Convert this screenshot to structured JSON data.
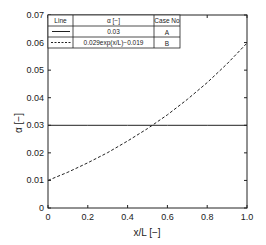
{
  "chart_data": {
    "type": "line",
    "title": "",
    "xlabel": "x/L [−]",
    "ylabel": "α [−]",
    "xlim": [
      0,
      1.0
    ],
    "ylim": [
      0,
      0.07
    ],
    "grid": false,
    "x_ticks": [
      0,
      0.2,
      0.4,
      0.6,
      0.8,
      1.0
    ],
    "x_tick_labels": [
      "0",
      "0.2",
      "0.4",
      "0.6",
      "0.8",
      "1.0"
    ],
    "y_ticks": [
      0,
      0.01,
      0.02,
      0.03,
      0.04,
      0.05,
      0.06,
      0.07
    ],
    "y_tick_labels": [
      "0",
      "0.01",
      "0.02",
      "0.03",
      "0.04",
      "0.05",
      "0.06",
      "0.07"
    ],
    "legend_position": "upper-left (table)",
    "legend_headers": [
      "Line",
      "α [−]",
      "Case No"
    ],
    "series": [
      {
        "name": "A",
        "case": "A",
        "style": "solid",
        "formula": "0.03",
        "x": [
          0,
          0.2,
          0.4,
          0.6,
          0.8,
          1.0
        ],
        "values": [
          0.03,
          0.03,
          0.03,
          0.03,
          0.03,
          0.03
        ]
      },
      {
        "name": "B",
        "case": "B",
        "style": "dashed",
        "formula": "0.029exp(x/L)−0.019",
        "x": [
          0,
          0.1,
          0.2,
          0.3,
          0.4,
          0.5,
          0.6,
          0.7,
          0.8,
          0.9,
          1.0
        ],
        "values": [
          0.01,
          0.013,
          0.0164,
          0.0201,
          0.0243,
          0.0288,
          0.0338,
          0.0394,
          0.0455,
          0.0523,
          0.0598
        ]
      }
    ]
  },
  "legend": {
    "header_line": "Line",
    "header_alpha": "α [−]",
    "header_case": "Case No",
    "rows": [
      {
        "alpha": "0.03",
        "case": "A"
      },
      {
        "alpha": "0.029exp(x/L)−0.019",
        "case": "B"
      }
    ]
  },
  "axes": {
    "xlabel": "x/L [−]",
    "ylabel": "α [−]",
    "x_tick_labels": [
      "0",
      "0.2",
      "0.4",
      "0.6",
      "0.8",
      "1.0"
    ],
    "y_tick_labels": [
      "0",
      "0.01",
      "0.02",
      "0.03",
      "0.04",
      "0.05",
      "0.06",
      "0.07"
    ]
  }
}
